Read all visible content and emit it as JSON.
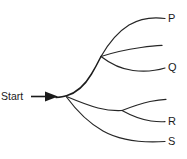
{
  "diagram": {
    "type": "branching-tree",
    "background_color": "#ffffff",
    "stroke_color": "#262626",
    "width": 187,
    "height": 159,
    "start": {
      "label": "Start",
      "arrow_icon": "right-arrow-icon",
      "x": 2,
      "y": 91
    },
    "nodes": [
      {
        "id": "root",
        "name": "root-node",
        "x": 66,
        "y": 96
      },
      {
        "id": "upper",
        "name": "upper-fork-node",
        "x": 101,
        "y": 56
      },
      {
        "id": "lower",
        "name": "lower-fork-node",
        "x": 122,
        "y": 110
      }
    ],
    "endpoints": [
      {
        "id": "P",
        "label": "P",
        "x": 168,
        "y": 17
      },
      {
        "id": "mid",
        "label": "",
        "x": 160,
        "y": 46
      },
      {
        "id": "Q",
        "label": "Q",
        "x": 168,
        "y": 66
      },
      {
        "id": "R",
        "label": "R",
        "x": 168,
        "y": 118
      },
      {
        "id": "S",
        "label": "S",
        "x": 168,
        "y": 138
      }
    ],
    "branches": [
      {
        "name": "stem-to-root",
        "from": "start",
        "to": "root"
      },
      {
        "name": "root-to-upper",
        "from": "root",
        "to": "upper"
      },
      {
        "name": "upper-to-P",
        "from": "upper",
        "to": "P"
      },
      {
        "name": "upper-to-mid",
        "from": "upper",
        "to": "mid"
      },
      {
        "name": "upper-to-Q",
        "from": "upper",
        "to": "Q"
      },
      {
        "name": "root-to-lower",
        "from": "root",
        "to": "lower"
      },
      {
        "name": "lower-to-top",
        "from": "lower",
        "to": "lower-top"
      },
      {
        "name": "lower-to-R",
        "from": "lower",
        "to": "R"
      },
      {
        "name": "root-to-S",
        "from": "root",
        "to": "S"
      }
    ]
  },
  "labels": {
    "start": "Start",
    "p": "P",
    "q": "Q",
    "r": "R",
    "s": "S"
  }
}
